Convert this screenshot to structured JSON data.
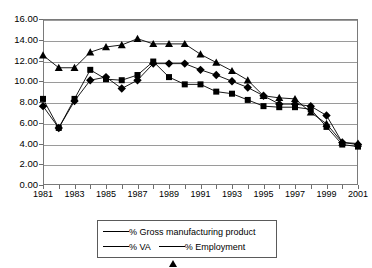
{
  "chart_data": {
    "type": "line",
    "title": "",
    "subtitle": "",
    "xlabel": "",
    "ylabel": "",
    "xlim": [
      1981,
      2001
    ],
    "ylim": [
      0,
      16
    ],
    "ytick_step": 2,
    "grid": true,
    "legend_position": "bottom",
    "yticks": [
      "0.00",
      "2.00",
      "4.00",
      "6.00",
      "8.00",
      "10.00",
      "12.00",
      "14.00",
      "16.00"
    ],
    "xticks": [
      "1981",
      "1983",
      "1985",
      "1987",
      "1989",
      "1991",
      "1993",
      "1995",
      "1997",
      "1999",
      "2001"
    ],
    "x": [
      1981,
      1982,
      1983,
      1984,
      1985,
      1986,
      1987,
      1988,
      1989,
      1990,
      1991,
      1992,
      1993,
      1994,
      1995,
      1996,
      1997,
      1998,
      1999,
      2000,
      2001
    ],
    "series": [
      {
        "name": "% Gross manufacturing product",
        "marker": "diamond",
        "color": "#000000",
        "values": [
          7.6,
          5.5,
          8.1,
          10.1,
          10.4,
          9.3,
          10.1,
          11.7,
          11.7,
          11.7,
          11.1,
          10.6,
          10.0,
          9.4,
          8.6,
          7.8,
          7.8,
          7.6,
          6.7,
          4.1,
          3.9
        ]
      },
      {
        "name": "% VA",
        "marker": "square",
        "color": "#000000",
        "values": [
          8.3,
          5.5,
          8.3,
          11.1,
          10.2,
          10.1,
          10.6,
          11.9,
          10.4,
          9.7,
          9.7,
          9.0,
          8.8,
          8.2,
          7.6,
          7.5,
          7.5,
          7.3,
          5.6,
          3.9,
          3.7
        ]
      },
      {
        "name": "% Employment",
        "marker": "triangle",
        "color": "#000000",
        "values": [
          12.5,
          11.3,
          11.3,
          12.8,
          13.3,
          13.5,
          14.1,
          13.6,
          13.6,
          13.6,
          12.6,
          11.8,
          11.0,
          10.1,
          8.6,
          8.4,
          8.3,
          7.0,
          5.9,
          4.1,
          4.0
        ]
      }
    ]
  },
  "legend": {
    "entries": [
      {
        "label": "% Gross manufacturing product",
        "marker": "diamond"
      },
      {
        "label": "% VA",
        "marker": "square"
      },
      {
        "label": "% Employment",
        "marker": "triangle"
      }
    ]
  }
}
